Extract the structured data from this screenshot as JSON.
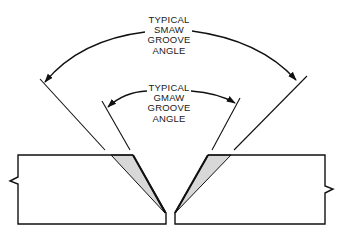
{
  "figure": {
    "type": "weld-joint-groove-angle-diagram",
    "colors": {
      "line": "#111111",
      "bevel_fill": "#d8d8d8",
      "background": "#ffffff"
    }
  },
  "labels": {
    "smaw": {
      "lines": [
        "TYPICAL",
        "SMAW",
        "GROOVE",
        "ANGLE"
      ]
    },
    "gmaw": {
      "lines": [
        "TYPICAL",
        "GMAW",
        "GROOVE",
        "ANGLE"
      ]
    }
  },
  "parts": {
    "left_plate": {
      "break_symbol": "zigzag-break-left"
    },
    "right_plate": {
      "break_symbol": "zigzag-break-right"
    }
  }
}
